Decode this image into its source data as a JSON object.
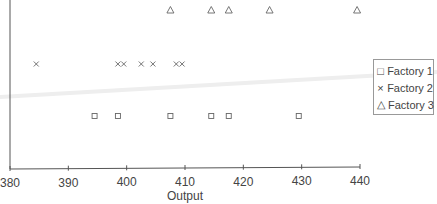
{
  "chart_data": {
    "type": "scatter",
    "title": "",
    "xlabel": "Output",
    "ylabel": "",
    "xlim": [
      380,
      440
    ],
    "x_ticks": [
      380,
      390,
      400,
      410,
      420,
      430,
      440
    ],
    "grid": false,
    "legend_position": "right",
    "series": [
      {
        "name": "Factory 1",
        "marker": "square",
        "x": [
          394.5,
          398.5,
          407.5,
          414.5,
          417.5,
          429.5
        ]
      },
      {
        "name": "Factory 2",
        "marker": "x",
        "x": [
          384.5,
          398.5,
          399.5,
          402.5,
          404.5,
          408.5,
          409.5
        ]
      },
      {
        "name": "Factory 3",
        "marker": "triangle",
        "x": [
          407.5,
          414.5,
          417.5,
          424.5,
          439.5
        ]
      }
    ]
  },
  "legend": {
    "items": [
      {
        "label": "Factory 1",
        "symbol": "□"
      },
      {
        "label": "Factory 2",
        "symbol": "×"
      },
      {
        "label": "Factory 3",
        "symbol": "△"
      }
    ]
  },
  "colors": {
    "marker": "#666666",
    "axis": "#555555",
    "legend_border": "#999999"
  }
}
